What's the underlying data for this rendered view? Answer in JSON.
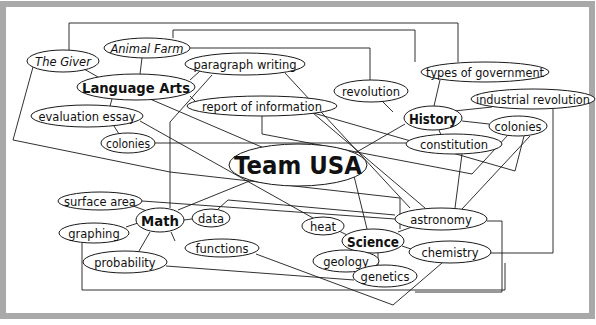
{
  "diagram": {
    "title": "Team USA",
    "frame": {
      "border_color": "#a9a9a9",
      "background": "#ffffff",
      "line_color": "#1a1a1a"
    },
    "nodes": [
      {
        "id": "team-usa",
        "label": "Team USA",
        "cx": 298,
        "cy": 165,
        "rx": 69,
        "ry": 21,
        "size": 24,
        "weight": "bold",
        "style": "normal"
      },
      {
        "id": "language-arts",
        "label": "Language Arts",
        "cx": 136,
        "cy": 87,
        "rx": 59,
        "ry": 13,
        "size": 14,
        "weight": "bold",
        "style": "normal"
      },
      {
        "id": "history",
        "label": "History",
        "cx": 433,
        "cy": 118,
        "rx": 29,
        "ry": 12,
        "size": 14,
        "weight": "bold",
        "style": "normal"
      },
      {
        "id": "math",
        "label": "Math",
        "cx": 160,
        "cy": 220,
        "rx": 24,
        "ry": 12,
        "size": 14,
        "weight": "bold",
        "style": "normal"
      },
      {
        "id": "science",
        "label": "Science",
        "cx": 373,
        "cy": 241,
        "rx": 31,
        "ry": 12,
        "size": 14,
        "weight": "bold",
        "style": "normal"
      },
      {
        "id": "the-giver",
        "label": "The Giver",
        "cx": 63,
        "cy": 61,
        "rx": 36,
        "ry": 11,
        "size": 11.5,
        "weight": "normal",
        "style": "italic"
      },
      {
        "id": "animal-farm",
        "label": "Animal Farm",
        "cx": 147,
        "cy": 48,
        "rx": 43,
        "ry": 10,
        "size": 11.5,
        "weight": "normal",
        "style": "italic"
      },
      {
        "id": "paragraph-writing",
        "label": "paragraph writing",
        "cx": 245,
        "cy": 64,
        "rx": 60,
        "ry": 11,
        "size": 11.5,
        "weight": "normal",
        "style": "normal"
      },
      {
        "id": "evaluation-essay",
        "label": "evaluation essay",
        "cx": 87,
        "cy": 116,
        "rx": 56,
        "ry": 11,
        "size": 11.5,
        "weight": "normal",
        "style": "normal"
      },
      {
        "id": "colonies-left",
        "label": "colonies",
        "cx": 128,
        "cy": 143,
        "rx": 27,
        "ry": 10,
        "size": 11.5,
        "weight": "normal",
        "style": "normal"
      },
      {
        "id": "report-of-information",
        "label": "report of information",
        "cx": 262,
        "cy": 106,
        "rx": 75,
        "ry": 10,
        "size": 11.5,
        "weight": "normal",
        "style": "normal"
      },
      {
        "id": "revolution",
        "label": "revolution",
        "cx": 371,
        "cy": 91,
        "rx": 37,
        "ry": 11,
        "size": 11.5,
        "weight": "normal",
        "style": "normal"
      },
      {
        "id": "types-of-government",
        "label": "types of government",
        "cx": 485,
        "cy": 72,
        "rx": 64,
        "ry": 10,
        "size": 11.5,
        "weight": "normal",
        "style": "normal"
      },
      {
        "id": "industrial-revolution",
        "label": "industrial revolution",
        "cx": 533,
        "cy": 99,
        "rx": 62,
        "ry": 10,
        "size": 11.5,
        "weight": "normal",
        "style": "normal"
      },
      {
        "id": "colonies-right",
        "label": "colonies",
        "cx": 518,
        "cy": 126,
        "rx": 29,
        "ry": 10,
        "size": 11.5,
        "weight": "normal",
        "style": "normal"
      },
      {
        "id": "constitution",
        "label": "constitution",
        "cx": 454,
        "cy": 144,
        "rx": 48,
        "ry": 10,
        "size": 11.5,
        "weight": "normal",
        "style": "normal"
      },
      {
        "id": "surface-area",
        "label": "surface area",
        "cx": 100,
        "cy": 201,
        "rx": 42,
        "ry": 9,
        "size": 11.5,
        "weight": "normal",
        "style": "normal"
      },
      {
        "id": "data",
        "label": "data",
        "cx": 211,
        "cy": 218,
        "rx": 19,
        "ry": 9,
        "size": 11.5,
        "weight": "normal",
        "style": "normal"
      },
      {
        "id": "graphing",
        "label": "graphing",
        "cx": 94,
        "cy": 233,
        "rx": 35,
        "ry": 10,
        "size": 11.5,
        "weight": "normal",
        "style": "normal"
      },
      {
        "id": "functions",
        "label": "functions",
        "cx": 222,
        "cy": 248,
        "rx": 37,
        "ry": 9,
        "size": 11.5,
        "weight": "normal",
        "style": "normal"
      },
      {
        "id": "probability",
        "label": "probability",
        "cx": 125,
        "cy": 262,
        "rx": 42,
        "ry": 11,
        "size": 11.5,
        "weight": "normal",
        "style": "normal"
      },
      {
        "id": "heat",
        "label": "heat",
        "cx": 323,
        "cy": 226,
        "rx": 21,
        "ry": 9,
        "size": 11.5,
        "weight": "normal",
        "style": "normal"
      },
      {
        "id": "astronomy",
        "label": "astronomy",
        "cx": 441,
        "cy": 219,
        "rx": 46,
        "ry": 11,
        "size": 11.5,
        "weight": "normal",
        "style": "normal"
      },
      {
        "id": "chemistry",
        "label": "chemistry",
        "cx": 450,
        "cy": 252,
        "rx": 41,
        "ry": 11,
        "size": 11.5,
        "weight": "normal",
        "style": "normal"
      },
      {
        "id": "geology",
        "label": "geology",
        "cx": 346,
        "cy": 261,
        "rx": 33,
        "ry": 11,
        "size": 11.5,
        "weight": "normal",
        "style": "normal"
      },
      {
        "id": "genetics",
        "label": "genetics",
        "cx": 385,
        "cy": 276,
        "rx": 32,
        "ry": 11,
        "size": 11.5,
        "weight": "normal",
        "style": "normal"
      }
    ],
    "edges": [
      {
        "from": "the-giver",
        "to": "language-arts",
        "points": "84,69 98,77"
      },
      {
        "from": "animal-farm",
        "to": "language-arts",
        "points": "142,58 140,74"
      },
      {
        "from": "paragraph-writing",
        "to": "language-arts",
        "points": "200,71 190,80"
      },
      {
        "from": "language-arts",
        "to": "evaluation-essay",
        "points": "112,99 110,106"
      },
      {
        "from": "evaluation-essay",
        "to": "colonies-left",
        "points": "114,126 119,134"
      },
      {
        "from": "language-arts",
        "to": "report-of-information",
        "points": "190,96 196,102"
      },
      {
        "from": "language-arts",
        "to": "team-usa",
        "points": "150,99 264,148"
      },
      {
        "from": "the-giver",
        "to": "types-of-government",
        "points": "69,50 69,23 458,23 458,62"
      },
      {
        "from": "animal-farm",
        "to": "types-of-government",
        "points": "173,38 173,30 415,30 415,62"
      },
      {
        "from": "animal-farm",
        "to": "revolution",
        "points": "190,48 370,48 370,80"
      },
      {
        "from": "the-giver",
        "to": "science",
        "points": "33,67 13,140 170,172 400,198 400,229"
      },
      {
        "from": "paragraph-writing",
        "to": "math",
        "points": "212,75 170,122 170,208"
      },
      {
        "from": "paragraph-writing",
        "to": "astronomy",
        "points": "285,73 410,208"
      },
      {
        "from": "evaluation-essay",
        "to": "heat",
        "points": "140,121 313,218"
      },
      {
        "from": "colonies-left",
        "to": "constitution",
        "points": "155,143 406,143"
      },
      {
        "from": "report-of-information",
        "to": "colonies-right",
        "points": "262,116 262,134 472,174 508,135"
      },
      {
        "from": "report-of-information",
        "to": "astronomy",
        "points": "313,113 425,208"
      },
      {
        "from": "report-of-information",
        "to": "colonies-right",
        "points": "310,112 515,171 524,136"
      },
      {
        "from": "revolution",
        "to": "history",
        "points": "382,101 393,112"
      },
      {
        "from": "types-of-government",
        "to": "history",
        "points": "440,80 434,106"
      },
      {
        "from": "industrial-revolution",
        "to": "history",
        "points": "492,107 454,111"
      },
      {
        "from": "history",
        "to": "colonies-right",
        "points": "462,121 489,124"
      },
      {
        "from": "history",
        "to": "constitution",
        "points": "439,130 441,135"
      },
      {
        "from": "history",
        "to": "team-usa",
        "points": "405,124 355,153"
      },
      {
        "from": "constitution",
        "to": "astronomy",
        "points": "462,154 455,208"
      },
      {
        "from": "colonies-right",
        "to": "astronomy",
        "points": "530,136 462,209"
      },
      {
        "from": "industrial-revolution",
        "to": "chemistry",
        "points": "553,109 553,253 491,253"
      },
      {
        "from": "team-usa",
        "to": "math",
        "points": "252,180 178,210"
      },
      {
        "from": "team-usa",
        "to": "science",
        "points": "354,176 367,229"
      },
      {
        "from": "surface-area",
        "to": "math",
        "points": "133,206 147,211"
      },
      {
        "from": "surface-area",
        "to": "astronomy",
        "points": "142,201 395,219"
      },
      {
        "from": "math",
        "to": "data",
        "points": "184,220 192,219"
      },
      {
        "from": "data",
        "to": "astronomy",
        "points": "218,209 228,200 395,215"
      },
      {
        "from": "graphing",
        "to": "math",
        "points": "126,227 138,223"
      },
      {
        "from": "math",
        "to": "probability",
        "points": "150,232 139,251"
      },
      {
        "from": "math",
        "to": "functions",
        "points": "171,232 175,241"
      },
      {
        "from": "graphing",
        "to": "chemistry",
        "points": "82,243 82,290 505,290 505,263"
      },
      {
        "from": "probability",
        "to": "genetics",
        "points": "166,266 354,280"
      },
      {
        "from": "functions",
        "to": "chemistry",
        "points": "256,254 393,305 442,263"
      },
      {
        "from": "heat",
        "to": "science",
        "points": "339,231 349,236"
      },
      {
        "from": "science",
        "to": "astronomy",
        "points": "398,232 412,227"
      },
      {
        "from": "science",
        "to": "chemistry",
        "points": "402,246 411,249"
      },
      {
        "from": "science",
        "to": "geology",
        "points": "356,252 350,250"
      },
      {
        "from": "science",
        "to": "genetics",
        "points": "378,253 378,265"
      },
      {
        "from": "astronomy",
        "to": "chemistry",
        "points": "487,221 502,221 502,292 415,292"
      }
    ]
  }
}
